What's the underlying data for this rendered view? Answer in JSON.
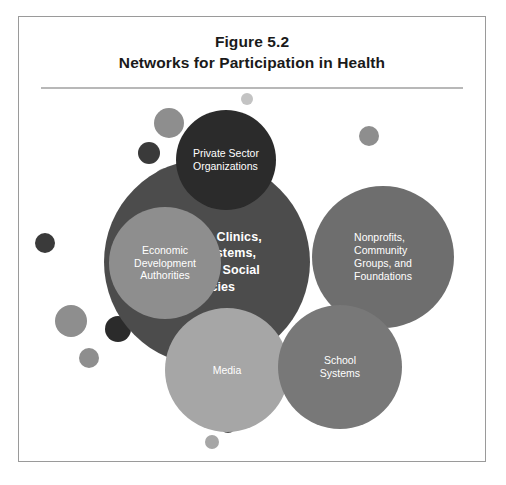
{
  "figure": {
    "number": "Figure 5.2",
    "title": "Networks for Participation in Health"
  },
  "palette": {
    "background": "#ffffff",
    "frame_border": "#9a9a9a",
    "rule": "#b8b8b8",
    "title_text": "#1a1a1a",
    "bubble_text": "#ffffff",
    "darkest": "#2b2b2b",
    "dark": "#4c4c4c",
    "mid_dark": "#6e6e6e",
    "mid": "#8e8e8e",
    "light": "#a6a6a6",
    "lightest": "#c3c3c3"
  },
  "chart_data": {
    "type": "bubble-network",
    "title": "Networks for Participation in Health",
    "nodes": [
      {
        "id": "hospitals",
        "label": "Hospitals, Clinics,\nHealth Systems,\nHealth and Social\nAgencies",
        "role": "primary",
        "color": "#4c4c4c",
        "cx": 188,
        "cy": 167,
        "r": 103,
        "align": "center"
      },
      {
        "id": "private-sector",
        "label": "Private Sector\nOrganizations",
        "role": "secondary",
        "color": "#2b2b2b",
        "cx": 207,
        "cy": 65,
        "r": 50,
        "align": "left"
      },
      {
        "id": "nonprofits",
        "label": "Nonprofits,\nCommunity\nGroups, and\nFoundations",
        "role": "secondary",
        "color": "#6e6e6e",
        "cx": 364,
        "cy": 162,
        "r": 71,
        "align": "left"
      },
      {
        "id": "economic-development",
        "label": "Economic\nDevelopment\nAuthorities",
        "role": "secondary",
        "color": "#8e8e8e",
        "cx": 146,
        "cy": 168,
        "r": 56,
        "align": "center"
      },
      {
        "id": "media",
        "label": "Media",
        "role": "secondary",
        "color": "#a6a6a6",
        "cx": 208,
        "cy": 275,
        "r": 62,
        "align": "center"
      },
      {
        "id": "school-systems",
        "label": "School\nSystems",
        "role": "secondary",
        "color": "#787878",
        "cx": 321,
        "cy": 272,
        "r": 62,
        "align": "center"
      }
    ],
    "decorative_dots": [
      {
        "cx": 228,
        "cy": 4,
        "r": 6,
        "color": "#c3c3c3"
      },
      {
        "cx": 150,
        "cy": 28,
        "r": 15,
        "color": "#8e8e8e"
      },
      {
        "cx": 130,
        "cy": 58,
        "r": 11,
        "color": "#3a3a3a"
      },
      {
        "cx": 147,
        "cy": 85,
        "r": 12,
        "color": "#8e8e8e"
      },
      {
        "cx": 350,
        "cy": 41,
        "r": 10,
        "color": "#8e8e8e"
      },
      {
        "cx": 332,
        "cy": 116,
        "r": 9,
        "color": "#8e8e8e"
      },
      {
        "cx": 26,
        "cy": 148,
        "r": 10,
        "color": "#3a3a3a"
      },
      {
        "cx": 52,
        "cy": 226,
        "r": 16,
        "color": "#8e8e8e"
      },
      {
        "cx": 70,
        "cy": 263,
        "r": 10,
        "color": "#8e8e8e"
      },
      {
        "cx": 99,
        "cy": 234,
        "r": 13,
        "color": "#2b2b2b"
      },
      {
        "cx": 313,
        "cy": 237,
        "r": 7,
        "color": "#a6a6a6"
      },
      {
        "cx": 299,
        "cy": 254,
        "r": 13,
        "color": "#2b2b2b"
      },
      {
        "cx": 184,
        "cy": 314,
        "r": 11,
        "color": "#8e8e8e"
      },
      {
        "cx": 209,
        "cy": 330,
        "r": 8,
        "color": "#4c4c4c"
      },
      {
        "cx": 193,
        "cy": 347,
        "r": 7,
        "color": "#a6a6a6"
      }
    ],
    "layout": {
      "canvas_width": 466,
      "canvas_height": 366,
      "legend": "none",
      "grid": false
    }
  }
}
